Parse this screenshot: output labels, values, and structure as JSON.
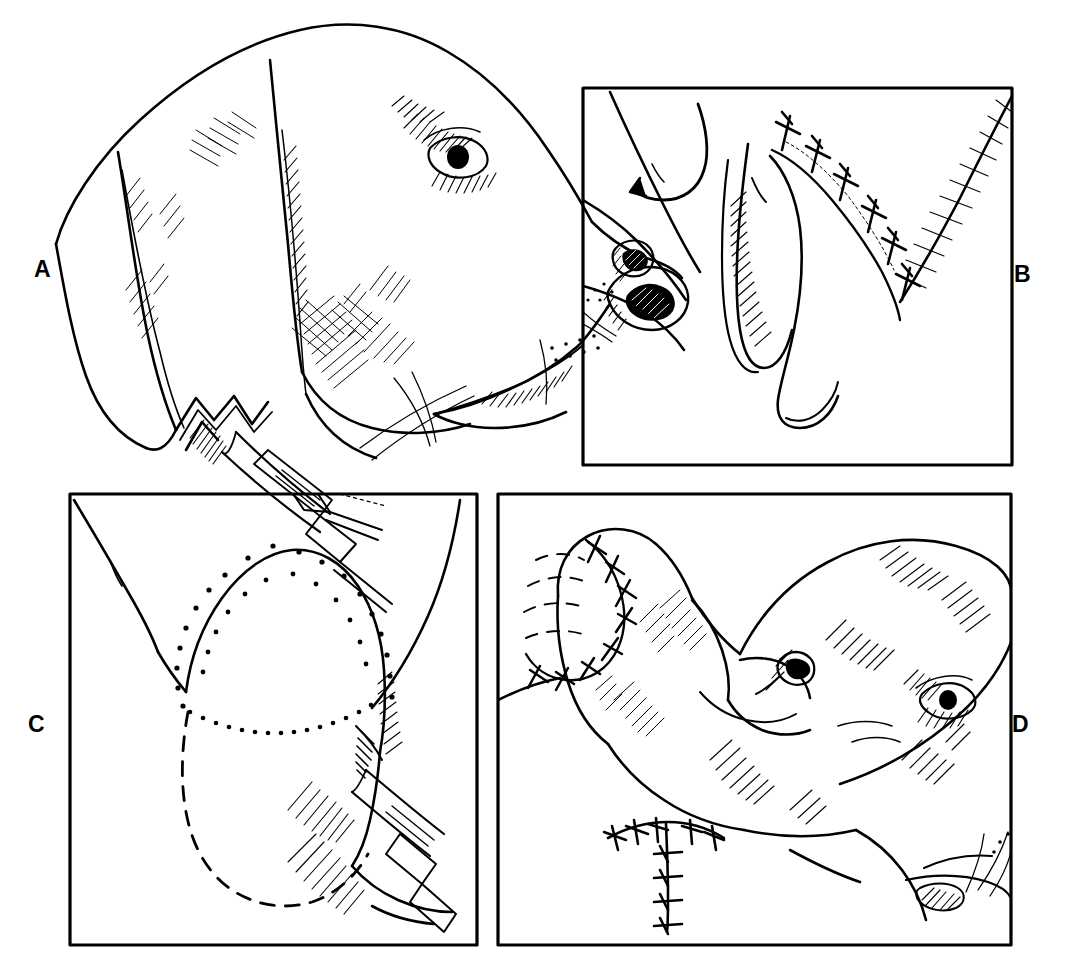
{
  "figure": {
    "background_color": "#ffffff",
    "ink_color": "#000000",
    "style": "black-and-white pen-and-ink line drawing with hatching",
    "width": 1084,
    "height": 974
  },
  "panels": [
    {
      "id": "A",
      "label": "A",
      "label_position": "left-middle",
      "framed": false,
      "caption_text": "",
      "content": "Lateral view of a dog's head with the ear pinna folded up; a scalpel makes the first vertical incision at the base of the ear canal.",
      "elements": [
        "dog-head-profile",
        "ear-pinna-folded",
        "eye",
        "nose",
        "muzzle",
        "whiskers",
        "scalpel",
        "incision-line"
      ]
    },
    {
      "id": "B",
      "label": "B",
      "label_position": "right-middle",
      "framed": true,
      "caption_text": "",
      "content": "Close-up of the vertical ear canal; the lateral wall flap is reflected ventrally and the skin edges are apposed with simple interrupted sutures.",
      "elements": [
        "ear-canal-flap",
        "suture-line",
        "suture-knots",
        "cut-cartilage-edge",
        "hatching-shadow"
      ],
      "suture_count": 6
    },
    {
      "id": "C",
      "label": "C",
      "label_position": "left-middle",
      "framed": true,
      "caption_text": "",
      "content": "Ear base with the planned resection outlined; a dotted line marks the skin incision and a dashed line marks the hidden margin of the vertical canal. A scalpel is positioned at the caudal edge.",
      "elements": [
        "resection-outline-dotted",
        "hidden-margin-dashed",
        "ear-canal-opening",
        "scalpel",
        "hatching-shadow"
      ]
    },
    {
      "id": "D",
      "label": "D",
      "label_position": "right-middle",
      "framed": true,
      "caption_text": "",
      "content": "Completed procedure: the head is shown with the ear pinna sutured closed and a T-shaped suture line at the ventral aspect of the resected canal.",
      "elements": [
        "dog-head-profile",
        "sutured-pinna",
        "t-shaped-suture-line",
        "eye",
        "nose",
        "muzzle"
      ],
      "suture_pattern": "T-shaped"
    }
  ],
  "labels": {
    "a": "A",
    "b": "B",
    "c": "C",
    "d": "D"
  }
}
